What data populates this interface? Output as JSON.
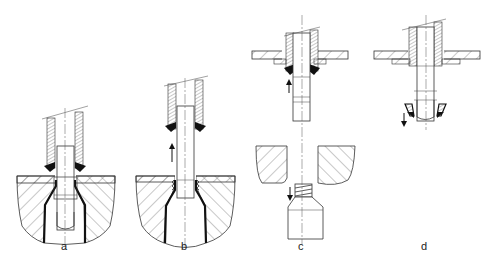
{
  "figure": {
    "panels": [
      {
        "id": "a",
        "label": "a",
        "arrow": "none"
      },
      {
        "id": "b",
        "label": "b",
        "arrow": "up"
      },
      {
        "id": "c",
        "label": "c",
        "arrow": "up-and-down"
      },
      {
        "id": "d",
        "label": "d",
        "arrow": "down"
      }
    ]
  },
  "colors": {
    "line": "#333333",
    "background": "#ffffff"
  }
}
